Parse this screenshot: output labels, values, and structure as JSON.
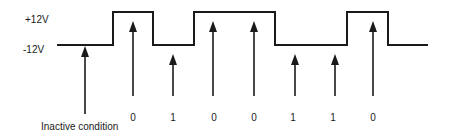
{
  "diagram": {
    "levels": {
      "high_label": "+12V",
      "low_label": "-12V"
    },
    "inactive_label": "Inactive condition",
    "bits": [
      {
        "value": "0",
        "level": "high"
      },
      {
        "value": "1",
        "level": "low"
      },
      {
        "value": "0",
        "level": "high"
      },
      {
        "value": "0",
        "level": "high"
      },
      {
        "value": "1",
        "level": "low"
      },
      {
        "value": "1",
        "level": "low"
      },
      {
        "value": "0",
        "level": "high"
      }
    ],
    "line_color": "#1a1a1a"
  }
}
